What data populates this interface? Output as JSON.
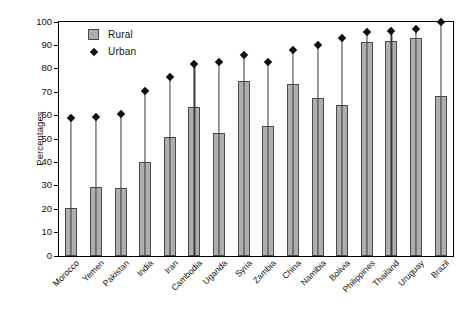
{
  "chart_data": {
    "type": "bar",
    "title": "",
    "subtitle": "",
    "xlabel": "",
    "ylabel": "Percentages",
    "ylim": [
      0,
      100
    ],
    "yticks": [
      0,
      10,
      20,
      30,
      40,
      50,
      60,
      70,
      80,
      90,
      100
    ],
    "grid": false,
    "legend_position": "top-left",
    "categories": [
      "Morocco",
      "Yemen",
      "Pakistan",
      "India",
      "Iran",
      "Cambodia",
      "Uganda",
      "Syria",
      "Zambia",
      "China",
      "Namibia",
      "Bolivia",
      "Philippines",
      "Thailand",
      "Uruguay",
      "Brazil"
    ],
    "series": [
      {
        "name": "Rural",
        "marker": "bar",
        "color": "#b0b0b0",
        "values": [
          20.5,
          29.5,
          29,
          40,
          51,
          63.5,
          52.5,
          75,
          55.5,
          73.5,
          67.5,
          64.5,
          91.5,
          92,
          93,
          68.5
        ]
      },
      {
        "name": "Urban",
        "marker": "diamond",
        "color": "#111111",
        "values": [
          59,
          59.5,
          60.5,
          70.5,
          76.5,
          82,
          83,
          86,
          83,
          88,
          90,
          93,
          95.5,
          96,
          97,
          100
        ]
      }
    ]
  },
  "legend": {
    "items": [
      {
        "label": "Rural",
        "icon": "filled-square-icon"
      },
      {
        "label": "Urban",
        "icon": "filled-diamond-icon"
      }
    ]
  },
  "axis": {
    "y_title": "Percentages",
    "y_tick_labels": [
      "0",
      "10",
      "20",
      "30",
      "40",
      "50",
      "60",
      "70",
      "80",
      "90",
      "100"
    ]
  }
}
